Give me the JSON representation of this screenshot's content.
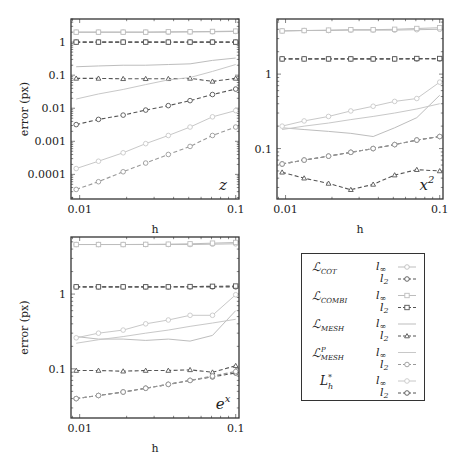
{
  "chart_data": [
    {
      "type": "line",
      "panel": "z",
      "title": "",
      "annotation": "z",
      "xlabel": "h",
      "ylabel": "error (px)",
      "xscale": "log",
      "yscale": "log",
      "xlim": [
        0.0088,
        0.105
      ],
      "ylim": [
        1.8e-05,
        5
      ],
      "xticks": [
        {
          "v": 0.01,
          "label": "0.01"
        },
        {
          "v": 0.1,
          "label": "0.1"
        }
      ],
      "yticks": [
        {
          "v": 1,
          "label": "1"
        },
        {
          "v": 0.1,
          "label": "0.1"
        },
        {
          "v": 0.01,
          "label": "0.01"
        },
        {
          "v": 0.001,
          "label": "0.001"
        },
        {
          "v": 0.0001,
          "label": "0.0001"
        }
      ],
      "x": [
        0.0095,
        0.0132,
        0.019,
        0.0265,
        0.037,
        0.051,
        0.071,
        0.1
      ],
      "series": [
        {
          "name": "L_COT l_inf",
          "style": "solid",
          "marker": "circle",
          "color": "#bdbdbd",
          "values": [
            2.0,
            2.0,
            2.0,
            2.0,
            2.0,
            2.05,
            2.05,
            2.1
          ]
        },
        {
          "name": "L_COT l2",
          "style": "dashed",
          "marker": "circle",
          "color": "#555555",
          "values": [
            1.0,
            1.0,
            1.0,
            1.0,
            1.0,
            1.0,
            1.0,
            1.0
          ]
        },
        {
          "name": "L_COMBI l_inf",
          "style": "solid",
          "marker": "square",
          "color": "#bdbdbd",
          "values": [
            2.0,
            2.0,
            2.0,
            2.0,
            2.05,
            2.05,
            2.1,
            2.15
          ]
        },
        {
          "name": "L_COMBI l2",
          "style": "dashed",
          "marker": "square",
          "color": "#555555",
          "values": [
            1.0,
            1.0,
            1.0,
            1.0,
            1.0,
            1.0,
            1.0,
            1.0
          ]
        },
        {
          "name": "L_MESH l_inf",
          "style": "solid",
          "marker": "none",
          "color": "#bdbdbd",
          "values": [
            0.18,
            0.19,
            0.2,
            0.2,
            0.21,
            0.22,
            0.28,
            0.33
          ]
        },
        {
          "name": "L_MESH l2",
          "style": "dashed",
          "marker": "triangle",
          "color": "#555555",
          "values": [
            0.08,
            0.08,
            0.078,
            0.078,
            0.078,
            0.08,
            0.065,
            0.08
          ]
        },
        {
          "name": "L_MESH^P l_inf",
          "style": "solid",
          "marker": "none",
          "color": "#c8c8c8",
          "values": [
            0.019,
            0.027,
            0.037,
            0.052,
            0.072,
            0.085,
            0.13,
            0.21
          ]
        },
        {
          "name": "L_MESH^P l2",
          "style": "dashed",
          "marker": "circle",
          "color": "#555555",
          "values": [
            0.0032,
            0.0046,
            0.0062,
            0.0088,
            0.012,
            0.017,
            0.026,
            0.038
          ]
        },
        {
          "name": "L_h* l_inf",
          "style": "solid",
          "marker": "circle",
          "color": "#c8c8c8",
          "values": [
            0.00015,
            0.00025,
            0.00045,
            0.00085,
            0.0015,
            0.0027,
            0.0055,
            0.0085
          ]
        },
        {
          "name": "L_h* l2",
          "style": "dashed",
          "marker": "circle",
          "color": "#9a9a9a",
          "values": [
            3.5e-05,
            6e-05,
            0.00012,
            0.00022,
            0.0004,
            0.0007,
            0.0015,
            0.0027
          ]
        }
      ]
    },
    {
      "type": "line",
      "panel": "x^2",
      "title": "",
      "annotation": "x",
      "annotation_sup": "2",
      "xlabel": "h",
      "ylabel": "",
      "xscale": "log",
      "yscale": "log",
      "xlim": [
        0.0088,
        0.105
      ],
      "ylim": [
        0.021,
        5.5
      ],
      "xticks": [
        {
          "v": 0.01,
          "label": "0.01"
        },
        {
          "v": 0.1,
          "label": "0.1"
        }
      ],
      "yticks": [
        {
          "v": 1,
          "label": "1"
        },
        {
          "v": 0.1,
          "label": "0.1"
        }
      ],
      "x": [
        0.0095,
        0.0132,
        0.019,
        0.0265,
        0.037,
        0.051,
        0.071,
        0.1
      ],
      "series": [
        {
          "name": "L_COT l_inf",
          "style": "solid",
          "marker": "circle",
          "color": "#bdbdbd",
          "values": [
            3.8,
            3.85,
            3.85,
            3.9,
            3.9,
            3.9,
            3.95,
            4.0
          ]
        },
        {
          "name": "L_COT l2",
          "style": "dashed",
          "marker": "circle",
          "color": "#555555",
          "values": [
            1.6,
            1.6,
            1.6,
            1.6,
            1.6,
            1.6,
            1.6,
            1.6
          ]
        },
        {
          "name": "L_COMBI l_inf",
          "style": "solid",
          "marker": "square",
          "color": "#bdbdbd",
          "values": [
            3.8,
            3.85,
            3.9,
            3.95,
            3.95,
            4.0,
            4.1,
            4.2
          ]
        },
        {
          "name": "L_COMBI l2",
          "style": "dashed",
          "marker": "square",
          "color": "#555555",
          "values": [
            1.6,
            1.6,
            1.6,
            1.6,
            1.6,
            1.6,
            1.62,
            1.62
          ]
        },
        {
          "name": "L_MESH l_inf",
          "style": "solid",
          "marker": "none",
          "color": "#bdbdbd",
          "values": [
            0.19,
            0.18,
            0.17,
            0.16,
            0.145,
            0.19,
            0.26,
            0.52
          ]
        },
        {
          "name": "L_MESH l2",
          "style": "dashed",
          "marker": "triangle",
          "color": "#555555",
          "values": [
            0.048,
            0.04,
            0.034,
            0.028,
            0.033,
            0.044,
            0.052,
            0.05
          ]
        },
        {
          "name": "L_MESH^P l_inf",
          "style": "solid",
          "marker": "none",
          "color": "#c8c8c8",
          "values": [
            0.18,
            0.2,
            0.22,
            0.245,
            0.27,
            0.3,
            0.34,
            0.4
          ]
        },
        {
          "name": "L_MESH^P l2",
          "style": "dashed",
          "marker": "circle",
          "color": "#555555",
          "values": [
            0.062,
            0.07,
            0.079,
            0.089,
            0.1,
            0.113,
            0.13,
            0.145
          ]
        },
        {
          "name": "L_h* l_inf",
          "style": "solid",
          "marker": "circle",
          "color": "#c8c8c8",
          "values": [
            0.2,
            0.235,
            0.27,
            0.32,
            0.37,
            0.43,
            0.47,
            0.78
          ]
        },
        {
          "name": "L_h* l2",
          "style": "dashed",
          "marker": "circle",
          "color": "#9a9a9a",
          "values": [
            0.062,
            0.07,
            0.079,
            0.089,
            0.1,
            0.113,
            0.13,
            0.145
          ]
        }
      ]
    },
    {
      "type": "line",
      "panel": "e^x",
      "title": "",
      "annotation": "e",
      "annotation_sup": "x",
      "xlabel": "h",
      "ylabel": "error (px)",
      "xscale": "log",
      "yscale": "log",
      "xlim": [
        0.0088,
        0.105
      ],
      "ylim": [
        0.022,
        5.8
      ],
      "xticks": [
        {
          "v": 0.01,
          "label": "0.01"
        },
        {
          "v": 0.1,
          "label": "0.1"
        }
      ],
      "yticks": [
        {
          "v": 1,
          "label": "1"
        },
        {
          "v": 0.1,
          "label": "0.1"
        }
      ],
      "x": [
        0.0095,
        0.0132,
        0.019,
        0.0265,
        0.037,
        0.051,
        0.071,
        0.1
      ],
      "series": [
        {
          "name": "L_COT l_inf",
          "style": "solid",
          "marker": "circle",
          "color": "#bdbdbd",
          "values": [
            4.6,
            4.6,
            4.6,
            4.6,
            4.6,
            4.6,
            4.65,
            4.7
          ]
        },
        {
          "name": "L_COT l2",
          "style": "dashed",
          "marker": "circle",
          "color": "#555555",
          "values": [
            1.25,
            1.25,
            1.25,
            1.25,
            1.25,
            1.25,
            1.25,
            1.25
          ]
        },
        {
          "name": "L_COMBI l_inf",
          "style": "solid",
          "marker": "square",
          "color": "#bdbdbd",
          "values": [
            4.6,
            4.6,
            4.6,
            4.62,
            4.65,
            4.7,
            4.8,
            4.9
          ]
        },
        {
          "name": "L_COMBI l2",
          "style": "dashed",
          "marker": "square",
          "color": "#555555",
          "values": [
            1.25,
            1.25,
            1.25,
            1.25,
            1.25,
            1.26,
            1.27,
            1.28
          ]
        },
        {
          "name": "L_MESH l_inf",
          "style": "solid",
          "marker": "none",
          "color": "#bdbdbd",
          "values": [
            0.27,
            0.25,
            0.25,
            0.24,
            0.25,
            0.235,
            0.28,
            0.6
          ]
        },
        {
          "name": "L_MESH l2",
          "style": "dashed",
          "marker": "triangle",
          "color": "#555555",
          "values": [
            0.095,
            0.095,
            0.093,
            0.095,
            0.095,
            0.097,
            0.09,
            0.11
          ]
        },
        {
          "name": "L_MESH^P l_inf",
          "style": "solid",
          "marker": "none",
          "color": "#c8c8c8",
          "values": [
            0.22,
            0.245,
            0.27,
            0.3,
            0.33,
            0.37,
            0.41,
            0.46
          ]
        },
        {
          "name": "L_MESH^P l2",
          "style": "dashed",
          "marker": "circle",
          "color": "#555555",
          "values": [
            0.04,
            0.044,
            0.049,
            0.055,
            0.062,
            0.07,
            0.078,
            0.088
          ]
        },
        {
          "name": "L_h* l_inf",
          "style": "solid",
          "marker": "circle",
          "color": "#c8c8c8",
          "values": [
            0.26,
            0.3,
            0.33,
            0.4,
            0.45,
            0.52,
            0.52,
            0.98
          ]
        },
        {
          "name": "L_h* l2",
          "style": "dashed",
          "marker": "circle",
          "color": "#9a9a9a",
          "values": [
            0.04,
            0.044,
            0.049,
            0.055,
            0.062,
            0.07,
            0.08,
            0.092
          ]
        }
      ]
    }
  ],
  "layout": {
    "panels": [
      {
        "left": 71,
        "top": 19,
        "right": 239,
        "bottom": 199,
        "ylabel_x": 28
      },
      {
        "left": 277,
        "top": 19,
        "right": 443,
        "bottom": 199,
        "ylabel_x": null
      },
      {
        "left": 71,
        "top": 237,
        "right": 239,
        "bottom": 418,
        "ylabel_x": 28
      }
    ]
  },
  "legend": {
    "entries": [
      {
        "method": "L",
        "sub": "COT",
        "sup": "",
        "norms": [
          {
            "label": "l",
            "sub": "∞",
            "style": "solid",
            "marker": "circle",
            "color": "#bdbdbd"
          },
          {
            "label": "l",
            "sub": "2",
            "style": "dashed",
            "marker": "circle",
            "color": "#555555"
          }
        ]
      },
      {
        "method": "L",
        "sub": "COMBI",
        "sup": "",
        "norms": [
          {
            "label": "l",
            "sub": "∞",
            "style": "solid",
            "marker": "square",
            "color": "#bdbdbd"
          },
          {
            "label": "l",
            "sub": "2",
            "style": "dashed",
            "marker": "square",
            "color": "#555555"
          }
        ]
      },
      {
        "method": "L",
        "sub": "MESH",
        "sup": "",
        "norms": [
          {
            "label": "l",
            "sub": "∞",
            "style": "solid",
            "marker": "none",
            "color": "#bdbdbd"
          },
          {
            "label": "l",
            "sub": "2",
            "style": "dashed",
            "marker": "triangle",
            "color": "#555555"
          }
        ]
      },
      {
        "method": "L",
        "sub": "MESH",
        "sup": "P",
        "norms": [
          {
            "label": "l",
            "sub": "∞",
            "style": "solid",
            "marker": "none",
            "color": "#c8c8c8"
          },
          {
            "label": "l",
            "sub": "2",
            "style": "dashed",
            "marker": "circle",
            "color": "#9a9a9a"
          }
        ]
      },
      {
        "method": "L*",
        "sub": "h",
        "sup": "*",
        "plain": true,
        "norms": [
          {
            "label": "l",
            "sub": "∞",
            "style": "solid",
            "marker": "circle",
            "color": "#c8c8c8"
          },
          {
            "label": "l",
            "sub": "2",
            "style": "dashed",
            "marker": "circle",
            "color": "#555555"
          }
        ]
      }
    ]
  }
}
